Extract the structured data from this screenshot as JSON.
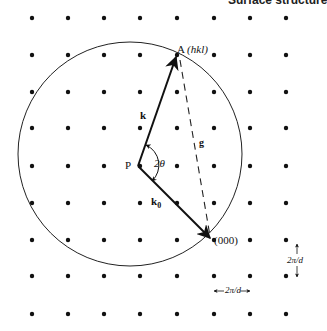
{
  "header": {
    "title": "Surface structure"
  },
  "diagram": {
    "lattice": {
      "columns_x": [
        32,
        68,
        104,
        140,
        177,
        214,
        250,
        286
      ],
      "rows_y": [
        18,
        55,
        92,
        128,
        166,
        203,
        240,
        276,
        314
      ],
      "spacing_label": "2π/d"
    },
    "labels": {
      "point_a": "A",
      "point_a_index": "(hkl)",
      "origin": "(000)",
      "center": "P",
      "k": "k",
      "k0": "k",
      "k0_sub": "0",
      "g": "g",
      "angle": "2θ",
      "spacing_horizontal": "2π/d",
      "spacing_vertical": "2π/d"
    },
    "colors": {
      "ink": "#111111",
      "background": "#ffffff"
    }
  },
  "caption": {
    "text": ""
  }
}
